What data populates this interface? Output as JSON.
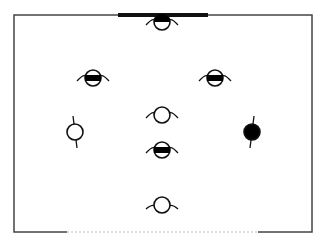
{
  "diagram": {
    "type": "tactical-formation-board",
    "frame": {
      "x": 14,
      "y": 15,
      "width": 298,
      "height": 217,
      "stroke": "#444444"
    },
    "top_bar": {
      "x1": 118,
      "x2": 208,
      "y": 15,
      "stroke": "#111111",
      "width": 4
    },
    "bottom_dotted": {
      "x1": 67,
      "x2": 258,
      "y": 232,
      "stroke": "#bbbbbb"
    },
    "players": [
      {
        "id": "p1",
        "x": 162,
        "y": 22,
        "fill": "half-top",
        "facing": "down",
        "arms": "horizontal"
      },
      {
        "id": "p2",
        "x": 93,
        "y": 78,
        "fill": "band",
        "facing": "down",
        "arms": "horizontal"
      },
      {
        "id": "p3",
        "x": 215,
        "y": 78,
        "fill": "band",
        "facing": "down",
        "arms": "horizontal"
      },
      {
        "id": "p4",
        "x": 162,
        "y": 115,
        "fill": "none",
        "facing": "down",
        "arms": "horizontal"
      },
      {
        "id": "p5",
        "x": 75,
        "y": 132,
        "fill": "none",
        "facing": "right",
        "arms": "vertical"
      },
      {
        "id": "p6",
        "x": 252,
        "y": 132,
        "fill": "solid",
        "facing": "left",
        "arms": "vertical"
      },
      {
        "id": "p7",
        "x": 162,
        "y": 150,
        "fill": "band",
        "facing": "down",
        "arms": "horizontal"
      },
      {
        "id": "p8",
        "x": 162,
        "y": 205,
        "fill": "none",
        "facing": "up",
        "arms": "horizontal"
      }
    ],
    "colors": {
      "stroke": "#111111",
      "fill": "#000000",
      "background": "#ffffff"
    }
  }
}
